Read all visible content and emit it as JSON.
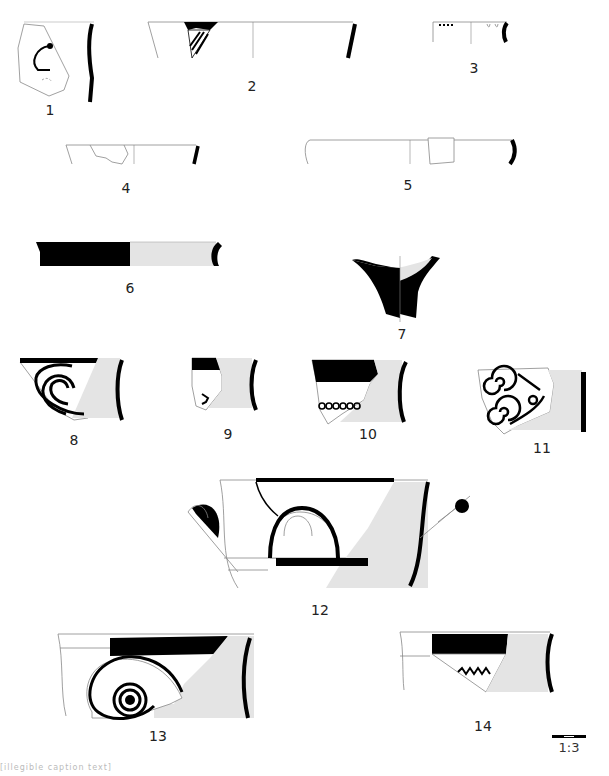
{
  "plate": {
    "title": "Pottery fragments drawing plate",
    "colors": {
      "paint": "#000000",
      "section_fill": "#e4e4e4",
      "outline": "#888888",
      "background": "#ffffff"
    }
  },
  "figures": [
    {
      "id": 1,
      "label": "1",
      "type": "body sherd with curvilinear painted motif and profile"
    },
    {
      "id": 2,
      "label": "2",
      "type": "rim with painted band and diagonal stripes"
    },
    {
      "id": 3,
      "label": "3",
      "type": "small rim with dot row"
    },
    {
      "id": 4,
      "label": "4",
      "type": "rim outline fragment"
    },
    {
      "id": 5,
      "label": "5",
      "type": "wide rim outline fragment"
    },
    {
      "id": 6,
      "label": "6",
      "type": "rim, painted exterior half / section half"
    },
    {
      "id": 7,
      "label": "7",
      "type": "foot / stem section"
    },
    {
      "id": 8,
      "label": "8",
      "type": "rim with concentric arcs"
    },
    {
      "id": 9,
      "label": "9",
      "type": "rim with band and small motif"
    },
    {
      "id": 10,
      "label": "10",
      "type": "rim with band and chain of circles"
    },
    {
      "id": 11,
      "label": "11",
      "type": "sherd with running spirals"
    },
    {
      "id": 12,
      "label": "12",
      "type": "handled bowl with painted arc and bands"
    },
    {
      "id": 13,
      "label": "13",
      "type": "rim with spiral motif"
    },
    {
      "id": 14,
      "label": "14",
      "type": "rim with band and zigzag"
    }
  ],
  "scale_bar": {
    "label": "1:3"
  },
  "caption": {
    "text": "[illegible caption text]"
  }
}
